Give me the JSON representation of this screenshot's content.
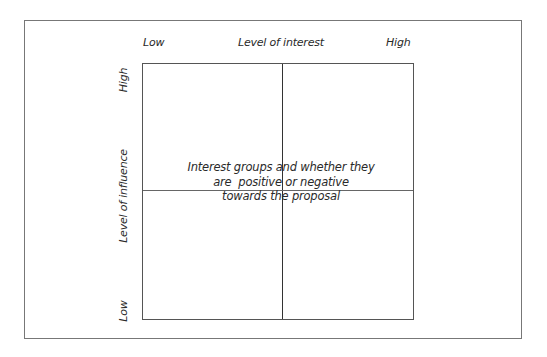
{
  "diagram": {
    "type": "2x2 matrix",
    "x_axis": {
      "title": "Level of interest",
      "low_label": "Low",
      "high_label": "High"
    },
    "y_axis": {
      "title": "Level of influence",
      "low_label": "Low",
      "high_label": "High"
    },
    "center_text": {
      "lines": [
        "Interest groups and whether they",
        "are  positive or negative",
        "towards the proposal"
      ]
    },
    "colors": {
      "background": "#ffffff",
      "frame_border": "#777777",
      "grid_lines": "#333333",
      "text": "#2a2a2a"
    }
  }
}
